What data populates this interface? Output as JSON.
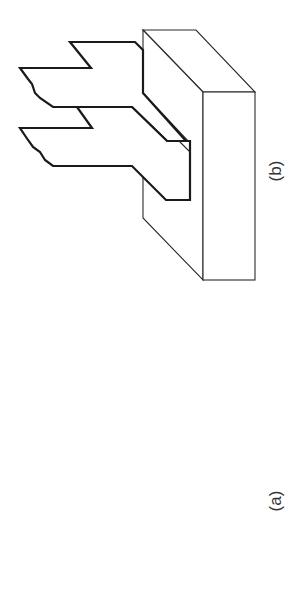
{
  "figure": {
    "panels": [
      {
        "id": "b",
        "label": "(b)",
        "position": "top"
      },
      {
        "id": "a",
        "label": "(a)",
        "position": "bottom"
      }
    ]
  },
  "colors": {
    "background": "#ffffff",
    "stroke": "#1a1a1a"
  }
}
